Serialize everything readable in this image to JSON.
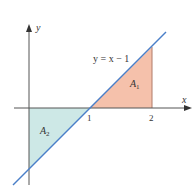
{
  "diagram": {
    "type": "area-between-curve-and-axis",
    "curve_label": "y = x − 1",
    "axes": {
      "x_label": "x",
      "y_label": "y"
    },
    "ticks": {
      "x": [
        "1",
        "2"
      ]
    },
    "regions": [
      {
        "name": "A",
        "sub": "1",
        "color": "#f5c1ab",
        "description": "area above x-axis from x=1 to x=2"
      },
      {
        "name": "A",
        "sub": "2",
        "color": "#cde8e6",
        "description": "area below x-axis from x=0 to x=1"
      }
    ],
    "colors": {
      "line": "#4a7fc8",
      "axis": "#555555"
    }
  }
}
